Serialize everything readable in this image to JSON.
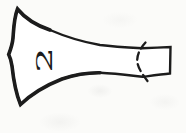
{
  "figure": {
    "label": "2",
    "ink_color": "#1c1c1c",
    "paper_color": "#fbfbf9"
  }
}
